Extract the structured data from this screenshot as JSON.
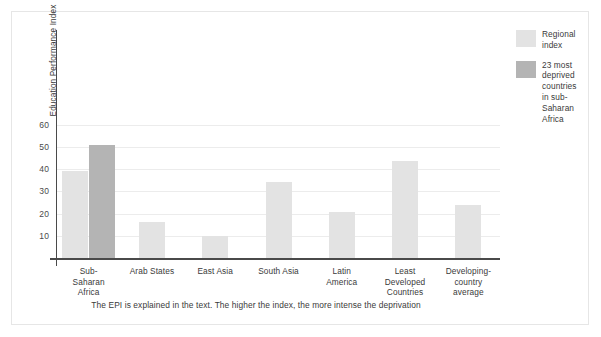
{
  "chart_data": {
    "type": "bar",
    "title": "",
    "subtitle": "",
    "xlabel": "",
    "ylabel": "Education Performance Index",
    "ylim": [
      0,
      62
    ],
    "yticks": [
      10,
      20,
      30,
      40,
      50,
      60
    ],
    "grid": true,
    "legend_position": "right",
    "categories": [
      "Sub-Saharan Africa",
      "Arab States",
      "East Asia",
      "South Asia",
      "Latin America",
      "Least Developed Countries",
      "Developing-country average"
    ],
    "category_lines": [
      [
        "Sub-",
        "Saharan",
        "Africa"
      ],
      [
        "Arab States"
      ],
      [
        "East Asia"
      ],
      [
        "South Asia"
      ],
      [
        "Latin",
        "America"
      ],
      [
        "Least",
        "Developed",
        "Countries"
      ],
      [
        "Developing-",
        "country",
        "average"
      ]
    ],
    "series": [
      {
        "name": "Regional index",
        "color": "#e3e3e3",
        "values": [
          39,
          16,
          10,
          34,
          20.5,
          43.5,
          24
        ]
      },
      {
        "name": "23 most deprived countries in sub-Saharan Africa",
        "color": "#b4b4b4",
        "values": [
          51,
          null,
          null,
          null,
          null,
          null,
          null
        ]
      }
    ],
    "annotations": [
      "The EPI is explained in the text. The higher the index, the more intense the deprivation"
    ]
  },
  "axis": {
    "y_title": "Education Performance Index",
    "y_tick_labels": [
      "60",
      "50",
      "40",
      "30",
      "20",
      "10"
    ]
  },
  "legend": {
    "entries": [
      {
        "label": "Regional\nindex",
        "label_lines": [
          "Regional",
          "index"
        ],
        "color": "#e3e3e3"
      },
      {
        "label": "23 most deprived countries in sub-Saharan Africa",
        "label_lines": [
          "23 most",
          "deprived",
          "countries",
          "in sub-",
          "Saharan",
          "Africa"
        ],
        "color": "#b4b4b4"
      }
    ]
  },
  "caption": {
    "text": "The EPI is explained in the text. The higher the index, the more intense the deprivation"
  },
  "colors": {
    "light_bar": "#e3e3e3",
    "dark_bar": "#b4b4b4",
    "axis": "#4a4a4a",
    "grid": "#ececec",
    "frame": "#e6e6e6",
    "text": "#3a3a3a"
  }
}
